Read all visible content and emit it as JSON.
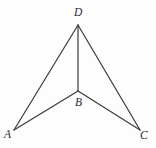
{
  "figure": {
    "type": "geometric-diagram",
    "background_color": "#fdfdfd",
    "stroke_color": "#3a3a3a",
    "stroke_width": 1.2,
    "label_color": "#2b2b2b",
    "vertices": [
      {
        "id": "D",
        "label": "D",
        "x": 78,
        "y": 25,
        "label_x": 74,
        "label_y": 7
      },
      {
        "id": "A",
        "label": "A",
        "x": 14,
        "y": 130,
        "label_x": 4,
        "label_y": 129
      },
      {
        "id": "B",
        "label": "B",
        "x": 78,
        "y": 91,
        "label_x": 75,
        "label_y": 97
      },
      {
        "id": "C",
        "label": "C",
        "x": 140,
        "y": 130,
        "label_x": 140,
        "label_y": 130
      }
    ],
    "segments": [
      {
        "id": "DA",
        "from": "D",
        "to": "A",
        "x1": 78,
        "y1": 25,
        "x2": 14,
        "y2": 130
      },
      {
        "id": "DC",
        "from": "D",
        "to": "C",
        "x1": 78,
        "y1": 25,
        "x2": 140,
        "y2": 130
      },
      {
        "id": "DB",
        "from": "D",
        "to": "B",
        "x1": 78,
        "y1": 25,
        "x2": 78,
        "y2": 91
      },
      {
        "id": "BA",
        "from": "B",
        "to": "A",
        "x1": 78,
        "y1": 91,
        "x2": 14,
        "y2": 130
      },
      {
        "id": "BC",
        "from": "B",
        "to": "C",
        "x1": 78,
        "y1": 91,
        "x2": 140,
        "y2": 130
      }
    ]
  }
}
